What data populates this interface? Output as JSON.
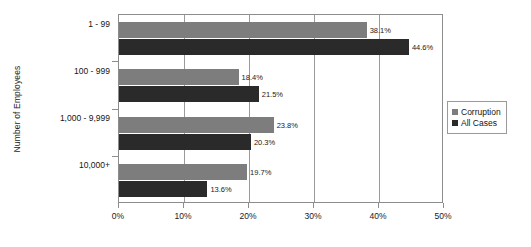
{
  "chart_data": {
    "type": "bar",
    "orientation": "horizontal",
    "title": "",
    "xlabel": "",
    "ylabel": "Number of Employees",
    "categories": [
      "1 - 99",
      "100 - 999",
      "1,000 - 9,999",
      "10,000+"
    ],
    "series": [
      {
        "name": "Corruption",
        "color": "#7d7d7d",
        "values": [
          38.1,
          18.4,
          23.8,
          19.7
        ],
        "labels": [
          "38.1%",
          "18.4%",
          "23.8%",
          "19.7%"
        ]
      },
      {
        "name": "All Cases",
        "color": "#2a2a2a",
        "values": [
          44.6,
          21.5,
          20.3,
          13.6
        ],
        "labels": [
          "44.6%",
          "21.5%",
          "20.3%",
          "13.6%"
        ]
      }
    ],
    "xlim": [
      0,
      50
    ],
    "xticks": [
      0,
      10,
      20,
      30,
      40,
      50
    ],
    "xtick_labels": [
      "0%",
      "10%",
      "20%",
      "30%",
      "40%",
      "50%"
    ],
    "grid": true,
    "grid_axis": "x",
    "legend_position": "right"
  },
  "legend": {
    "items": [
      {
        "label": "Corruption"
      },
      {
        "label": "All Cases"
      }
    ]
  }
}
